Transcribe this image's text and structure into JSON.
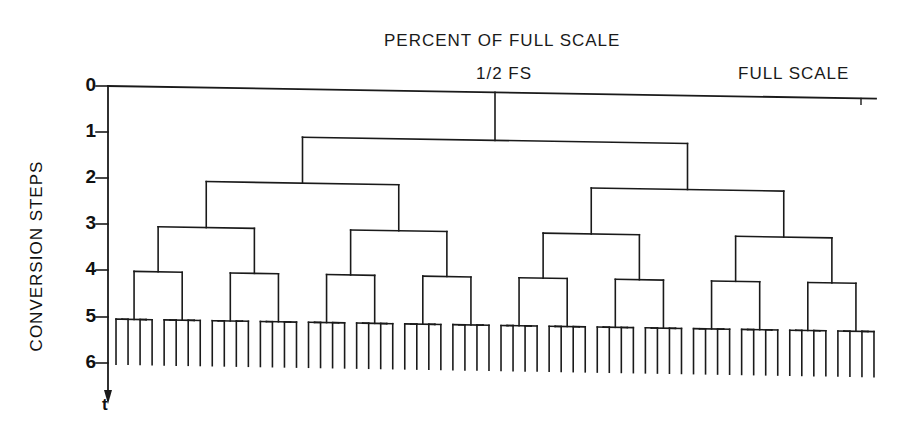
{
  "title": "PERCENT OF FULL SCALE",
  "top_labels": {
    "half": "1/2 FS",
    "full": "FULL SCALE"
  },
  "y_axis": {
    "label": "CONVERSION STEPS",
    "ticks": [
      "0",
      "1",
      "2",
      "3",
      "4",
      "5",
      "6"
    ],
    "arrow_label": "t"
  },
  "tree": {
    "type": "binary-search-tree",
    "levels": 6,
    "leaves": 64,
    "description": "Successive approximation conversion: each step halves the remaining range, branching left/right"
  },
  "colors": {
    "line": "#1a1a1a",
    "background": "#ffffff"
  }
}
